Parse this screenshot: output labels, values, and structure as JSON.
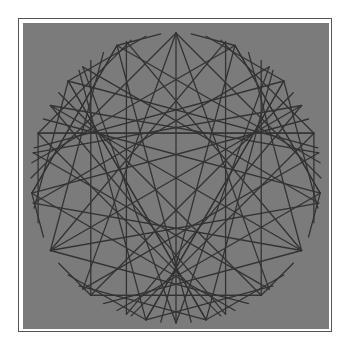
{
  "figure": {
    "colors": {
      "page_background": "#ffffff",
      "frame": "#555555",
      "panel": "#7b7b7b",
      "line": "#333333"
    },
    "circle": {
      "cx": 176,
      "cy": 178,
      "r": 145
    },
    "envelope": {
      "points": 60,
      "multiplier": 4,
      "start_angle_deg": -90
    },
    "star": {
      "points": 18,
      "step": 7,
      "start_angle_deg": -90
    }
  }
}
